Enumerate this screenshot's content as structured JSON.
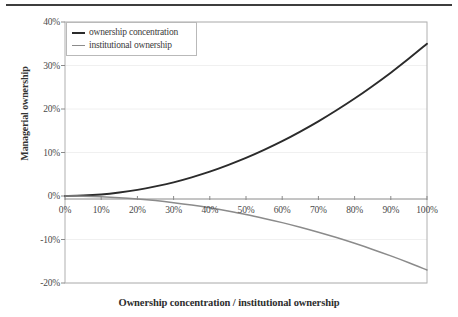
{
  "chart_data": {
    "type": "line",
    "title": "",
    "xlabel": "Ownership concentration / institutional ownership",
    "ylabel": "Managerial ownership",
    "xlim": [
      0,
      100
    ],
    "ylim": [
      -20,
      40
    ],
    "grid": true,
    "legend_position": "top-left",
    "x_tick_labels": [
      "0%",
      "10%",
      "20%",
      "30%",
      "40%",
      "50%",
      "60%",
      "70%",
      "80%",
      "90%",
      "100%"
    ],
    "y_tick_labels": [
      "40%",
      "30%",
      "20%",
      "10%",
      "0%",
      "-10%",
      "-20%"
    ],
    "x_ticks": [
      0,
      10,
      20,
      30,
      40,
      50,
      60,
      70,
      80,
      90,
      100
    ],
    "y_ticks": [
      40,
      30,
      20,
      10,
      0,
      -10,
      -20
    ],
    "x": [
      0,
      5,
      10,
      15,
      20,
      25,
      30,
      35,
      40,
      45,
      50,
      55,
      60,
      65,
      70,
      75,
      80,
      85,
      90,
      95,
      100
    ],
    "series": [
      {
        "name": "ownership concentration",
        "color": "#2b2b2b",
        "width": 1.9,
        "values": [
          0.0,
          0.1,
          0.35,
          0.8,
          1.4,
          2.2,
          3.15,
          4.3,
          5.6,
          7.1,
          8.75,
          10.6,
          12.6,
          14.8,
          17.15,
          19.7,
          22.4,
          25.3,
          28.35,
          31.6,
          35.0
        ]
      },
      {
        "name": "institutional ownership",
        "color": "#8b8b8b",
        "width": 1.5,
        "values": [
          0.0,
          -0.05,
          -0.17,
          -0.38,
          -0.68,
          -1.06,
          -1.53,
          -2.08,
          -2.72,
          -3.45,
          -4.25,
          -5.15,
          -6.12,
          -7.18,
          -8.33,
          -9.56,
          -10.88,
          -12.28,
          -13.77,
          -15.34,
          -17.0
        ]
      }
    ]
  },
  "legend": {
    "items": [
      {
        "label": "ownership concentration"
      },
      {
        "label": "institutional ownership"
      }
    ]
  },
  "axes": {
    "y_title": "Managerial ownership",
    "x_title": "Ownership concentration / institutional ownership"
  }
}
